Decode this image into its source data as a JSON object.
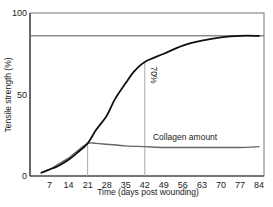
{
  "chart_data": {
    "type": "line",
    "title": "",
    "xlabel": "Time (days post wounding)",
    "ylabel": "Tensile strength (%)",
    "xlim": [
      0,
      86
    ],
    "ylim": [
      0,
      100
    ],
    "x_ticks": [
      7,
      14,
      21,
      28,
      35,
      42,
      49,
      56,
      63,
      70,
      77,
      84
    ],
    "y_ticks": [
      0,
      50,
      100
    ],
    "grid": false,
    "series": [
      {
        "name": "Tensile strength",
        "color": "#111111",
        "x": [
          4,
          7,
          10,
          14,
          17,
          21,
          24,
          28,
          31,
          35,
          38,
          42,
          49,
          56,
          63,
          70,
          77,
          84
        ],
        "y": [
          2,
          4,
          6,
          10,
          14,
          20,
          28,
          37,
          47,
          57,
          64,
          70,
          75,
          80,
          83,
          85,
          86,
          86
        ]
      },
      {
        "name": "Collagen amount",
        "color": "#666666",
        "x": [
          4,
          7,
          10,
          14,
          17,
          21,
          24,
          28,
          35,
          42,
          49,
          56,
          63,
          70,
          77,
          84
        ],
        "y": [
          2,
          4,
          7,
          11,
          15,
          20,
          20,
          19.5,
          18.5,
          18,
          17.5,
          17.5,
          17.5,
          17.5,
          17.5,
          18
        ]
      }
    ],
    "reference_lines": [
      {
        "orientation": "horizontal",
        "y": 86,
        "color": "#555555"
      },
      {
        "orientation": "vertical",
        "x": 21,
        "y_to": 20,
        "color": "#aaaaaa"
      },
      {
        "orientation": "vertical",
        "x": 42,
        "y_to": 70,
        "color": "#aaaaaa"
      }
    ],
    "annotations": [
      {
        "text": "70%",
        "x": 43,
        "y": 62,
        "rotation": 90
      },
      {
        "text": "Collagen amount",
        "x": 45,
        "y": 21
      }
    ]
  },
  "labels": {
    "xlabel": "Time (days post wounding)",
    "ylabel": "Tensile strength (%)",
    "annotation_70": "70%",
    "annotation_collagen": "Collagen amount"
  }
}
